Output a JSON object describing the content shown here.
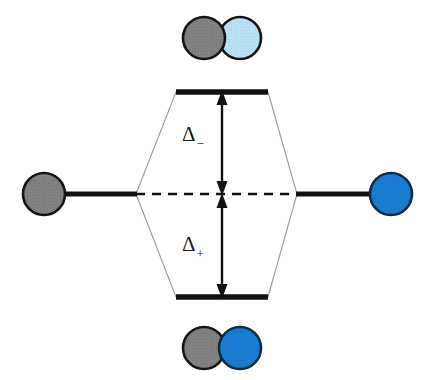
{
  "figure": {
    "type": "molecular-orbital-energy-diagram",
    "title": "",
    "background_color": "#ffffff",
    "width": 431,
    "height": 380
  },
  "colors": {
    "gray_orbital": "#808080",
    "gray_orbital_outline": "#141414",
    "blue_orbital": "#1a7fd4",
    "blue_orbital_outline": "#0d2b44",
    "pale_blue_orbital": "#b5ddf2",
    "pale_blue_orbital_outline": "#141414",
    "level_line": "#111111",
    "correlation_line": "#9a9a9a",
    "arrow": "#111111",
    "dashed_line": "#111111",
    "text": "#1a1a1a"
  },
  "labels": {
    "delta_minus": "Δ",
    "delta_minus_sub": "−",
    "delta_plus": "Δ",
    "delta_plus_sub": "+"
  },
  "levels": {
    "antibonding": {
      "name": "antibonding-level",
      "y": 92,
      "x_start": 176,
      "x_end": 268
    },
    "bonding": {
      "name": "bonding-level",
      "y": 297,
      "x_start": 176,
      "x_end": 268
    },
    "reference": {
      "name": "nonbonding-reference-level",
      "y": 194
    },
    "atomic_left": {
      "name": "left-atomic-level",
      "y": 194,
      "x_start": 64,
      "x_end": 136
    },
    "atomic_right": {
      "name": "right-atomic-level",
      "y": 194,
      "x_start": 297,
      "x_end": 370
    }
  },
  "arrows": {
    "delta_minus_arrow": {
      "name": "delta-minus-arrow",
      "x": 222,
      "y_top": 92,
      "y_bottom": 194,
      "double_headed": true
    },
    "delta_plus_arrow": {
      "name": "delta-plus-arrow",
      "x": 222,
      "y_top": 194,
      "y_bottom": 297,
      "double_headed": true
    }
  },
  "dashed_line": {
    "name": "nonbonding-dashed-line",
    "y": 194,
    "x_start": 136,
    "x_end": 297,
    "dash": "9 7"
  },
  "correlation_lines": [
    {
      "name": "correlation-left-up",
      "x1": 136,
      "y1": 194,
      "x2": 176,
      "y2": 92
    },
    {
      "name": "correlation-left-down",
      "x1": 136,
      "y1": 194,
      "x2": 176,
      "y2": 297
    },
    {
      "name": "correlation-right-up",
      "x1": 297,
      "y1": 194,
      "x2": 268,
      "y2": 92
    },
    {
      "name": "correlation-right-down",
      "x1": 297,
      "y1": 194,
      "x2": 268,
      "y2": 297
    }
  ],
  "orbitals": {
    "left_atomic": {
      "name": "left-atomic-orbital",
      "cx": 44,
      "cy": 194,
      "r": 21,
      "fill": "#808080",
      "stroke": "#141414"
    },
    "right_atomic": {
      "name": "right-atomic-orbital",
      "cx": 391,
      "cy": 194,
      "r": 21,
      "fill": "#1a7fd4",
      "stroke": "#0d2b44"
    },
    "antibonding_pair": {
      "name": "antibonding-orbital-overlap",
      "left_circle": {
        "cx": 204,
        "cy": 38,
        "r": 21,
        "fill": "#808080",
        "stroke": "#141414"
      },
      "right_circle": {
        "cx": 240,
        "cy": 38,
        "r": 21,
        "fill": "#b5ddf2",
        "stroke": "#141414"
      },
      "top_circle_is": "left"
    },
    "bonding_pair": {
      "name": "bonding-orbital-overlap",
      "left_circle": {
        "cx": 204,
        "cy": 348,
        "r": 21,
        "fill": "#808080",
        "stroke": "#141414"
      },
      "right_circle": {
        "cx": 240,
        "cy": 348,
        "r": 21,
        "fill": "#1a7fd4",
        "stroke": "#0d2b44"
      },
      "top_circle_is": "right"
    }
  }
}
